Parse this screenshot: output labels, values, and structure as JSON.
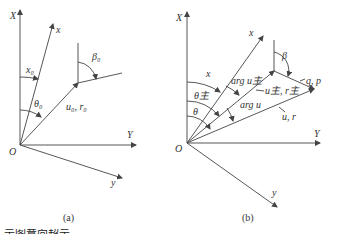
{
  "diagram_a": {
    "caption": "(a)",
    "labels": {
      "X": "X",
      "x": "x",
      "Y": "Y",
      "y": "y",
      "O": "O",
      "x0": "x₀",
      "theta0": "θ₀",
      "u0r0": "u₀, r₀",
      "beta0": "β₀"
    }
  },
  "diagram_b": {
    "caption": "(b)",
    "labels": {
      "X": "X",
      "x": "x",
      "Y": "Y",
      "y": "y",
      "O": "O",
      "x_angle": "x",
      "theta_main": "θ主",
      "theta": "θ",
      "arg_u_main": "arg u主",
      "arg_u": "arg u",
      "u_main_r_main": "u主, r主",
      "u_r": "u, r",
      "beta": "β",
      "q_p": "q, p"
    }
  },
  "footer_text": "示图意向超示"
}
